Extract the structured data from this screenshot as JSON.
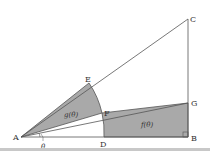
{
  "diagram": {
    "points": {
      "A": {
        "label": "A",
        "x": 21,
        "y": 137
      },
      "B": {
        "label": "B",
        "x": 188,
        "y": 137
      },
      "C": {
        "label": "C",
        "x": 188,
        "y": 19
      },
      "D": {
        "label": "D",
        "x": 104,
        "y": 137
      },
      "E": {
        "label": "E",
        "x": 89,
        "y": 83
      },
      "F": {
        "label": "F",
        "x": 102,
        "y": 113
      },
      "G": {
        "label": "G",
        "x": 188,
        "y": 103
      }
    },
    "regions": {
      "sector": {
        "label": "g(θ)",
        "fill": "#a9a9a9"
      },
      "quad": {
        "label": "f(θ)",
        "fill": "#a9a9a9"
      }
    },
    "angle_label": "θ",
    "line_color": "#555555"
  }
}
